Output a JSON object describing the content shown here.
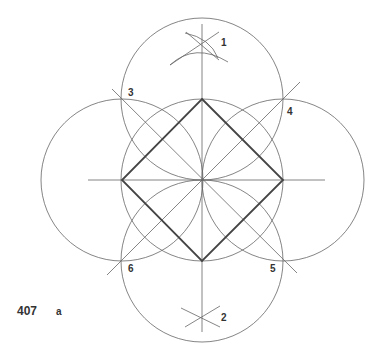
{
  "figure": {
    "number": "407",
    "sublabel": "a"
  },
  "points": [
    {
      "id": "1",
      "label": "1"
    },
    {
      "id": "2",
      "label": "2"
    },
    {
      "id": "3",
      "label": "3"
    },
    {
      "id": "4",
      "label": "4"
    },
    {
      "id": "5",
      "label": "5"
    },
    {
      "id": "6",
      "label": "6"
    }
  ],
  "colors": {
    "thin": "#666666",
    "thick": "#444444"
  }
}
